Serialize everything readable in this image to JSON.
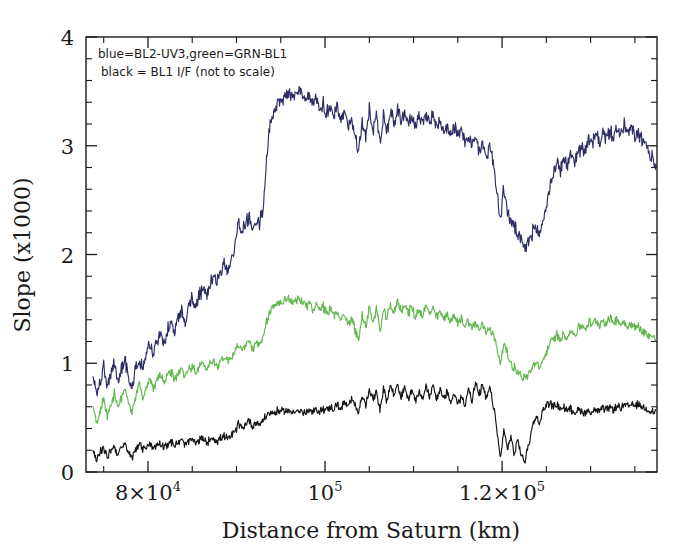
{
  "figure": {
    "background_color": "#ffffff",
    "annotation_line1": "blue=BL2-UV3,green=GRN-BL1",
    "annotation_line2": "black = BL1 I/F (not to scale)"
  },
  "axes": {
    "xlabel": "Distance from Saturn (km)",
    "ylabel": "Slope (x1000)",
    "x_tick_labels": [
      "8×10",
      "10",
      "1.2×10"
    ],
    "x_tick_exponents": [
      "4",
      "5",
      "5"
    ],
    "y_tick_labels": [
      "0",
      "1",
      "2",
      "3",
      "4"
    ]
  },
  "chart_data": {
    "type": "line",
    "title": "",
    "xlabel": "Distance from Saturn (km)",
    "ylabel": "Slope (x1000)",
    "xlim": [
      73000,
      137500
    ],
    "ylim": [
      0,
      4
    ],
    "xticks": [
      80000,
      100000,
      120000
    ],
    "xtick_labels": [
      "8×10⁴",
      "10⁵",
      "1.2×10⁵"
    ],
    "yticks": [
      0,
      1,
      2,
      3,
      4
    ],
    "grid": false,
    "legend": "inline-annotation-top-left",
    "annotations": [
      "blue=BL2-UV3,green=GRN-BL1",
      "black = BL1 I/F (not to scale)"
    ],
    "series": [
      {
        "name": "BL2-UV3",
        "color": "#2e2e66",
        "x": [
          73800,
          74200,
          74600,
          75000,
          75400,
          75800,
          76200,
          76600,
          77000,
          77400,
          77800,
          78200,
          78600,
          79000,
          79400,
          79800,
          80200,
          80600,
          81000,
          81400,
          81800,
          82200,
          82600,
          83000,
          83400,
          83800,
          84200,
          84600,
          85000,
          85400,
          85800,
          86200,
          86600,
          87000,
          87400,
          87800,
          88200,
          88600,
          89000,
          89400,
          89800,
          90200,
          90600,
          91000,
          91400,
          91800,
          92200,
          92600,
          93000,
          93400,
          93800,
          94200,
          94600,
          95000,
          95400,
          95800,
          96200,
          96600,
          97000,
          97400,
          97800,
          98200,
          98600,
          99000,
          99400,
          99800,
          100200,
          100600,
          101000,
          101400,
          101800,
          102200,
          102600,
          103000,
          103400,
          103800,
          104200,
          104600,
          105000,
          105400,
          105800,
          106200,
          106600,
          107000,
          107400,
          107800,
          108200,
          108600,
          109000,
          109400,
          109800,
          110200,
          110600,
          111000,
          111400,
          111800,
          112200,
          112600,
          113000,
          113400,
          113800,
          114200,
          114600,
          115000,
          115400,
          115800,
          116200,
          116600,
          117000,
          117400,
          117800,
          118200,
          118600,
          119000,
          119400,
          119800,
          120200,
          120600,
          121000,
          121400,
          121800,
          122200,
          122600,
          123000,
          123400,
          123800,
          124200,
          124600,
          125000,
          125400,
          125800,
          126200,
          126600,
          127000,
          127400,
          127800,
          128200,
          128600,
          129000,
          129400,
          129800,
          130200,
          130600,
          131000,
          131400,
          131800,
          132200,
          132600,
          133000,
          133400,
          133800,
          134200,
          134600,
          135000,
          135400,
          135800,
          136200,
          136600,
          137000,
          137400
        ],
        "y": [
          0.88,
          0.7,
          0.83,
          0.95,
          0.78,
          0.9,
          1.0,
          0.84,
          0.95,
          1.02,
          0.88,
          0.78,
          0.95,
          1.05,
          0.92,
          1.1,
          1.18,
          1.08,
          1.2,
          1.28,
          1.18,
          1.3,
          1.38,
          1.28,
          1.4,
          1.48,
          1.4,
          1.52,
          1.6,
          1.52,
          1.62,
          1.7,
          1.62,
          1.72,
          1.8,
          1.74,
          1.84,
          1.92,
          1.86,
          1.96,
          2.05,
          2.3,
          2.2,
          2.28,
          2.35,
          2.25,
          2.32,
          2.28,
          2.4,
          2.9,
          3.2,
          3.3,
          3.38,
          3.42,
          3.46,
          3.5,
          3.44,
          3.48,
          3.52,
          3.44,
          3.4,
          3.46,
          3.38,
          3.42,
          3.34,
          3.38,
          3.3,
          3.36,
          3.28,
          3.34,
          3.22,
          3.3,
          3.18,
          3.26,
          3.1,
          2.95,
          3.25,
          3.05,
          3.35,
          3.12,
          3.3,
          3.02,
          3.28,
          3.14,
          3.32,
          3.2,
          3.34,
          3.24,
          3.3,
          3.22,
          3.28,
          3.18,
          3.26,
          3.2,
          3.3,
          3.22,
          3.28,
          3.18,
          3.24,
          3.14,
          3.2,
          3.1,
          3.18,
          3.08,
          3.14,
          3.04,
          3.1,
          3.0,
          3.06,
          2.96,
          3.02,
          2.9,
          3.0,
          2.85,
          2.6,
          2.3,
          2.62,
          2.4,
          2.3,
          2.25,
          2.18,
          2.1,
          2.05,
          2.12,
          2.2,
          2.25,
          2.18,
          2.3,
          2.45,
          2.62,
          2.75,
          2.85,
          2.78,
          2.88,
          2.82,
          2.92,
          2.86,
          2.95,
          3.0,
          2.95,
          3.05,
          3.02,
          3.1,
          3.04,
          3.12,
          3.06,
          3.14,
          3.08,
          3.16,
          3.1,
          3.18,
          3.12,
          3.16,
          3.08,
          3.12,
          3.04,
          3.0,
          2.94,
          2.88,
          2.8
        ]
      },
      {
        "name": "GRN-BL1",
        "color": "#62b84f",
        "x": [
          73800,
          74200,
          74600,
          75000,
          75400,
          75800,
          76200,
          76600,
          77000,
          77400,
          77800,
          78200,
          78600,
          79000,
          79400,
          79800,
          80200,
          80600,
          81000,
          81400,
          81800,
          82200,
          82600,
          83000,
          83400,
          83800,
          84200,
          84600,
          85000,
          85400,
          85800,
          86200,
          86600,
          87000,
          87400,
          87800,
          88200,
          88600,
          89000,
          89400,
          89800,
          90200,
          90600,
          91000,
          91400,
          91800,
          92200,
          92600,
          93000,
          93400,
          93800,
          94200,
          94600,
          95000,
          95400,
          95800,
          96200,
          96600,
          97000,
          97400,
          97800,
          98200,
          98600,
          99000,
          99400,
          99800,
          100200,
          100600,
          101000,
          101400,
          101800,
          102200,
          102600,
          103000,
          103400,
          103800,
          104200,
          104600,
          105000,
          105400,
          105800,
          106200,
          106600,
          107000,
          107400,
          107800,
          108200,
          108600,
          109000,
          109400,
          109800,
          110200,
          110600,
          111000,
          111400,
          111800,
          112200,
          112600,
          113000,
          113400,
          113800,
          114200,
          114600,
          115000,
          115400,
          115800,
          116200,
          116600,
          117000,
          117400,
          117800,
          118200,
          118600,
          119000,
          119400,
          119800,
          120200,
          120600,
          121000,
          121400,
          121800,
          122200,
          122600,
          123000,
          123400,
          123800,
          124200,
          124600,
          125000,
          125400,
          125800,
          126200,
          126600,
          127000,
          127400,
          127800,
          128200,
          128600,
          129000,
          129400,
          129800,
          130200,
          130600,
          131000,
          131400,
          131800,
          132200,
          132600,
          133000,
          133400,
          133800,
          134200,
          134600,
          135000,
          135400,
          135800,
          136200,
          136600,
          137000,
          137400
        ],
        "y": [
          0.62,
          0.45,
          0.55,
          0.68,
          0.52,
          0.62,
          0.72,
          0.58,
          0.68,
          0.78,
          0.65,
          0.55,
          0.7,
          0.8,
          0.68,
          0.78,
          0.85,
          0.76,
          0.84,
          0.9,
          0.82,
          0.88,
          0.92,
          0.85,
          0.9,
          0.95,
          0.88,
          0.94,
          0.98,
          0.92,
          0.96,
          1.0,
          0.95,
          0.99,
          1.02,
          0.98,
          1.02,
          1.06,
          1.02,
          1.06,
          1.1,
          1.18,
          1.12,
          1.16,
          1.2,
          1.14,
          1.18,
          1.16,
          1.22,
          1.38,
          1.48,
          1.52,
          1.55,
          1.57,
          1.58,
          1.6,
          1.56,
          1.58,
          1.6,
          1.55,
          1.52,
          1.56,
          1.5,
          1.54,
          1.48,
          1.52,
          1.46,
          1.5,
          1.44,
          1.48,
          1.4,
          1.46,
          1.35,
          1.42,
          1.3,
          1.22,
          1.45,
          1.32,
          1.52,
          1.38,
          1.5,
          1.3,
          1.48,
          1.4,
          1.55,
          1.45,
          1.58,
          1.48,
          1.55,
          1.46,
          1.52,
          1.42,
          1.5,
          1.44,
          1.52,
          1.46,
          1.5,
          1.42,
          1.48,
          1.4,
          1.46,
          1.38,
          1.44,
          1.36,
          1.42,
          1.34,
          1.4,
          1.32,
          1.38,
          1.3,
          1.36,
          1.28,
          1.34,
          1.26,
          1.15,
          1.0,
          1.18,
          1.08,
          1.0,
          0.96,
          0.92,
          0.88,
          0.86,
          0.9,
          0.96,
          1.0,
          0.95,
          1.02,
          1.1,
          1.18,
          1.22,
          1.26,
          1.22,
          1.28,
          1.24,
          1.3,
          1.26,
          1.32,
          1.35,
          1.32,
          1.38,
          1.35,
          1.4,
          1.36,
          1.4,
          1.37,
          1.41,
          1.38,
          1.4,
          1.36,
          1.38,
          1.34,
          1.36,
          1.32,
          1.34,
          1.3,
          1.28,
          1.26,
          1.24,
          1.22
        ]
      },
      {
        "name": "BL1 I/F (not to scale)",
        "color": "#141414",
        "x": [
          73800,
          74200,
          74600,
          75000,
          75400,
          75800,
          76200,
          76600,
          77000,
          77400,
          77800,
          78200,
          78600,
          79000,
          79400,
          79800,
          80200,
          80600,
          81000,
          81400,
          81800,
          82200,
          82600,
          83000,
          83400,
          83800,
          84200,
          84600,
          85000,
          85400,
          85800,
          86200,
          86600,
          87000,
          87400,
          87800,
          88200,
          88600,
          89000,
          89400,
          89800,
          90200,
          90600,
          91000,
          91400,
          91800,
          92200,
          92600,
          93000,
          93400,
          93800,
          94200,
          94600,
          95000,
          95400,
          95800,
          96200,
          96600,
          97000,
          97400,
          97800,
          98200,
          98600,
          99000,
          99400,
          99800,
          100200,
          100600,
          101000,
          101400,
          101800,
          102200,
          102600,
          103000,
          103400,
          103800,
          104200,
          104600,
          105000,
          105400,
          105800,
          106200,
          106600,
          107000,
          107400,
          107800,
          108200,
          108600,
          109000,
          109400,
          109800,
          110200,
          110600,
          111000,
          111400,
          111800,
          112200,
          112600,
          113000,
          113400,
          113800,
          114200,
          114600,
          115000,
          115400,
          115800,
          116200,
          116600,
          117000,
          117400,
          117800,
          118200,
          118600,
          119000,
          119400,
          119800,
          120200,
          120600,
          121000,
          121400,
          121800,
          122200,
          122600,
          123000,
          123400,
          123800,
          124200,
          124600,
          125000,
          125400,
          125800,
          126200,
          126600,
          127000,
          127400,
          127800,
          128200,
          128600,
          129000,
          129400,
          129800,
          130200,
          130600,
          131000,
          131400,
          131800,
          132200,
          132600,
          133000,
          133400,
          133800,
          134200,
          134600,
          135000,
          135400,
          135800,
          136200,
          136600,
          137000,
          137400
        ],
        "y": [
          0.2,
          0.1,
          0.18,
          0.22,
          0.14,
          0.2,
          0.24,
          0.16,
          0.22,
          0.25,
          0.18,
          0.12,
          0.22,
          0.26,
          0.2,
          0.24,
          0.26,
          0.22,
          0.25,
          0.27,
          0.24,
          0.26,
          0.28,
          0.24,
          0.27,
          0.29,
          0.25,
          0.28,
          0.3,
          0.26,
          0.29,
          0.31,
          0.27,
          0.3,
          0.32,
          0.28,
          0.31,
          0.33,
          0.3,
          0.33,
          0.36,
          0.45,
          0.4,
          0.44,
          0.48,
          0.42,
          0.46,
          0.44,
          0.48,
          0.52,
          0.55,
          0.54,
          0.56,
          0.55,
          0.57,
          0.56,
          0.55,
          0.57,
          0.56,
          0.55,
          0.54,
          0.56,
          0.55,
          0.57,
          0.56,
          0.58,
          0.57,
          0.6,
          0.58,
          0.62,
          0.58,
          0.64,
          0.6,
          0.66,
          0.62,
          0.55,
          0.72,
          0.6,
          0.78,
          0.65,
          0.75,
          0.58,
          0.76,
          0.66,
          0.8,
          0.7,
          0.82,
          0.68,
          0.78,
          0.66,
          0.76,
          0.64,
          0.74,
          0.68,
          0.78,
          0.7,
          0.8,
          0.68,
          0.76,
          0.66,
          0.74,
          0.64,
          0.72,
          0.62,
          0.7,
          0.6,
          0.78,
          0.66,
          0.82,
          0.7,
          0.8,
          0.66,
          0.78,
          0.62,
          0.4,
          0.12,
          0.38,
          0.22,
          0.32,
          0.16,
          0.3,
          0.14,
          0.1,
          0.26,
          0.4,
          0.52,
          0.44,
          0.56,
          0.62,
          0.64,
          0.6,
          0.62,
          0.58,
          0.6,
          0.56,
          0.58,
          0.55,
          0.57,
          0.56,
          0.55,
          0.56,
          0.55,
          0.57,
          0.56,
          0.58,
          0.57,
          0.59,
          0.58,
          0.6,
          0.59,
          0.61,
          0.6,
          0.62,
          0.61,
          0.62,
          0.6,
          0.58,
          0.57,
          0.56,
          0.55
        ]
      }
    ]
  }
}
